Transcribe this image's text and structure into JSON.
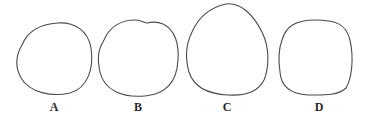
{
  "figure": {
    "stroke_color": "#4a4a4a",
    "background": "#ffffff",
    "shapes": [
      {
        "id": "A",
        "label": "A",
        "description": "roughly circular outline, slightly flattened"
      },
      {
        "id": "B",
        "label": "B",
        "description": "rounded outline with slight notch at top"
      },
      {
        "id": "C",
        "label": "C",
        "description": "tall oval outline, narrower at top"
      },
      {
        "id": "D",
        "label": "D",
        "description": "rounded-square outline"
      }
    ]
  }
}
